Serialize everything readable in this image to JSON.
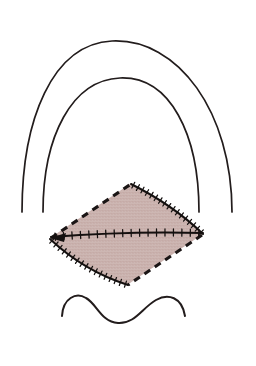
{
  "figure": {
    "background_color": "#ffffff",
    "ink_color": "#221c1c",
    "flap_fill_color": "#c9b0ab",
    "flap_fill_color_lower": "#cdb7b2",
    "canvas": {
      "width": 256,
      "height": 366
    }
  },
  "elements": {
    "outer_arch": {
      "label": "outer arch contour",
      "path": "M 22 212 C 22 120, 52 44, 112 41 C 178 38, 232 112, 232 212",
      "stroke_color": "#221c1c",
      "stroke_width": 1.7
    },
    "inner_arch": {
      "label": "inner arch contour",
      "path": "M 43 212 C 43 136, 72 80, 120 78 C 170 76, 199 134, 199 212",
      "stroke_color": "#221c1c",
      "stroke_width": 1.7
    },
    "wavy_border": {
      "label": "wavy vermillion border",
      "path": "M 62 316 C 63 298, 76 292, 86 298 C 97 304, 101 322, 118 323 C 135 324, 142 308, 156 300 C 168 293, 182 297, 185 316",
      "stroke_color": "#221c1c",
      "stroke_width": 2.0
    },
    "flap": {
      "label": "rhomboid skin flap",
      "vertices": {
        "left": [
          50,
          238
        ],
        "top": [
          130,
          184
        ],
        "right": [
          203,
          234
        ],
        "bottom": [
          127,
          285
        ]
      },
      "outline_path": "M 50 238 L 130 184 Q 172 204, 203 234 L 127 285 Q 83 269, 50 238 Z",
      "fill": "#c9b0ab"
    },
    "dashed_edges": [
      {
        "label": "upper-left dashed incision line",
        "path": "M 51 238 L 131 184"
      },
      {
        "label": "lower-right dashed incision line",
        "path": "M 202 235 L 128 285"
      }
    ],
    "suture_lines": [
      {
        "label": "upper-right sutured edge",
        "path": "M 131 184 Q 173 205, 203 234",
        "tick_count": 17
      },
      {
        "label": "lower-left sutured edge",
        "path": "M 50 239 Q 84 271, 128 285",
        "tick_count": 17
      },
      {
        "label": "central horizontal sutured closure line",
        "path": "M 51 237 Q 128 231, 203 233",
        "tick_count": 18
      }
    ],
    "arrow_head": {
      "label": "left vertex arrow marker",
      "path": "M 50 238 L 66 233 L 64 242 Z"
    }
  }
}
